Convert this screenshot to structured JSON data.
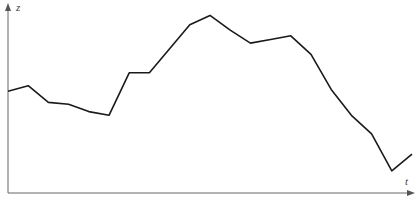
{
  "chart_data": {
    "type": "line",
    "title": "",
    "xlabel": "t",
    "ylabel": "z",
    "grid": false,
    "legend": null,
    "ticks": "none",
    "x": [
      1,
      2,
      3,
      4,
      5,
      6,
      7,
      8,
      9,
      10,
      11,
      12,
      13,
      14,
      15,
      16,
      17,
      18,
      19,
      20,
      21
    ],
    "series": [
      {
        "name": "z(t)",
        "values": [
          55,
          58,
          49,
          48,
          44,
          42,
          65,
          65,
          78,
          91,
          96,
          88,
          81,
          83,
          85,
          75,
          56,
          42,
          32,
          12,
          21
        ]
      }
    ],
    "ylim": [
      0,
      100
    ],
    "colors": {
      "line": "#1a1a1a",
      "axis": "#555555"
    }
  },
  "axes": {
    "x_label": "t",
    "y_label": "z"
  }
}
